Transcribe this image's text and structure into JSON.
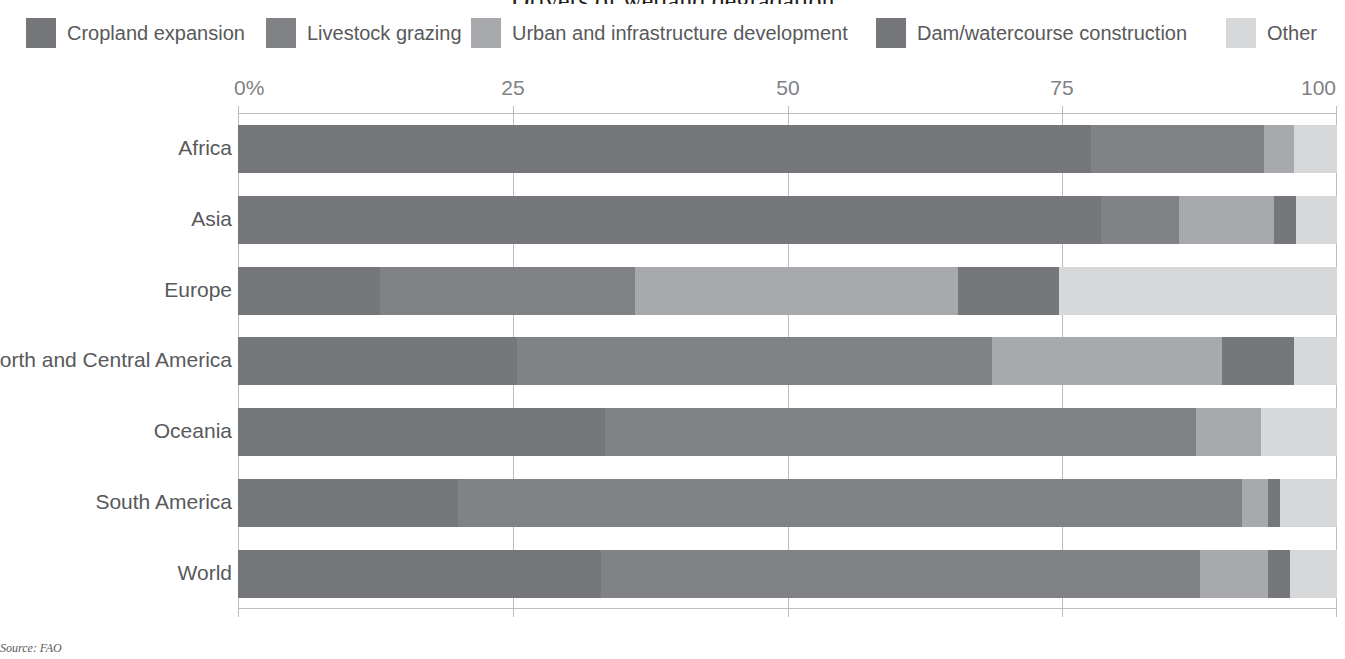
{
  "chart_data": {
    "type": "bar",
    "subtype": "stacked-horizontal-100",
    "title": "Drivers of wetland degradation",
    "xlabel": "",
    "ylabel": "",
    "xlim": [
      0,
      100
    ],
    "xticks": [
      0,
      25,
      50,
      75,
      100
    ],
    "xtick_labels": [
      "0%",
      "25",
      "50",
      "75",
      "100"
    ],
    "grid": true,
    "legend_position": "top",
    "categories": [
      "Africa",
      "Asia",
      "Europe",
      "North and Central America",
      "Oceania",
      "South America",
      "World"
    ],
    "series": [
      {
        "name": "Cropland expansion",
        "color": "#76777a",
        "values": [
          77.6,
          78.5,
          12.9,
          25.4,
          33.4,
          20.0,
          33.0
        ]
      },
      {
        "name": "Livestock grazing",
        "color": "#808285",
        "values": [
          15.8,
          7.1,
          23.2,
          43.2,
          53.8,
          71.4,
          54.5
        ]
      },
      {
        "name": "Urban and infrastructure development",
        "color": "#a7a9ac",
        "values": [
          2.7,
          8.7,
          29.4,
          20.9,
          5.9,
          2.3,
          6.2
        ]
      },
      {
        "name": "Dam/watercourse construction",
        "color": "#76777a",
        "values": [
          0.0,
          2.0,
          9.2,
          6.6,
          0.0,
          1.1,
          2.0
        ]
      },
      {
        "name": "Other",
        "color": "#d7d8da",
        "values": [
          3.9,
          3.7,
          25.3,
          3.9,
          6.9,
          5.2,
          4.3
        ]
      }
    ]
  },
  "legend": {
    "items": [
      {
        "label": "Cropland expansion",
        "color": "#76777a",
        "x": 26,
        "swatch": "legend-swatch-cropland"
      },
      {
        "label": "Livestock grazing",
        "color": "#808285",
        "x": 266,
        "swatch": "legend-swatch-livestock"
      },
      {
        "label": "Urban and infrastructure development",
        "color": "#a7a9ac",
        "x": 471,
        "swatch": "legend-swatch-urban"
      },
      {
        "label": "Dam/watercourse construction",
        "color": "#76777a",
        "x": 876,
        "swatch": "legend-swatch-dam"
      },
      {
        "label": "Other",
        "color": "#d7d8da",
        "x": 1226,
        "swatch": "legend-swatch-other"
      }
    ]
  },
  "axis": {
    "ticks": [
      {
        "label": "0%",
        "value": 0
      },
      {
        "label": "25",
        "value": 25
      },
      {
        "label": "50",
        "value": 50
      },
      {
        "label": "75",
        "value": 75
      },
      {
        "label": "100",
        "value": 100
      }
    ]
  },
  "footer": {
    "source": "Source: FAO"
  }
}
